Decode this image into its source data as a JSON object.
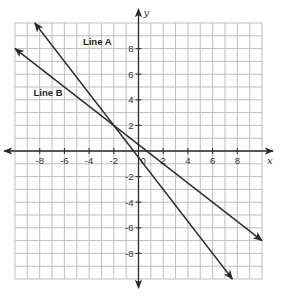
{
  "chart_data": {
    "type": "line",
    "title": "",
    "xlabel": "x",
    "ylabel": "y",
    "xlim": [
      -10,
      10
    ],
    "ylim": [
      -10,
      10
    ],
    "grid": true,
    "grid_step": 1,
    "x_ticks": [
      -8,
      -6,
      -4,
      -2,
      2,
      4,
      6,
      8
    ],
    "y_ticks": [
      8,
      6,
      4,
      2,
      -2,
      -4,
      -6,
      -8
    ],
    "x_tick_labels": [
      "-8",
      "-6",
      "-4",
      "-2",
      "2",
      "4",
      "6",
      "8"
    ],
    "y_tick_labels": [
      "8",
      "6",
      "4",
      "2",
      "-2",
      "-4",
      "-6",
      "-8"
    ],
    "origin_label": "0",
    "series": [
      {
        "name": "Line A",
        "slope": -1.25,
        "intercept": -0.5,
        "x": [
          -8.4,
          7.6
        ],
        "y": [
          10,
          -10
        ],
        "label_at": [
          -4.5,
          8.3
        ]
      },
      {
        "name": "Line B",
        "slope": -0.75,
        "intercept": 0.5,
        "x": [
          -10,
          10
        ],
        "y": [
          8,
          -7
        ],
        "label_at": [
          -8.5,
          4.3
        ]
      }
    ],
    "intersection": [
      -2,
      2
    ]
  }
}
